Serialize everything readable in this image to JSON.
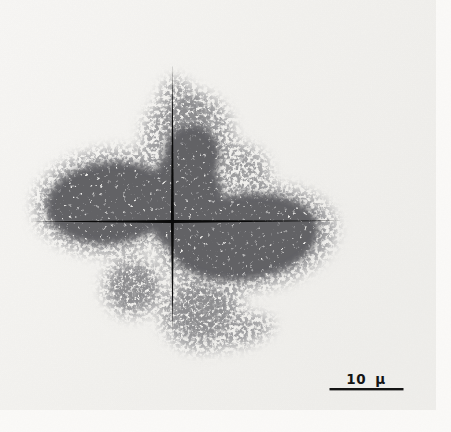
{
  "figure": {
    "kind": "micrograph-photograph",
    "scale_bar": {
      "label": "10 μ"
    },
    "colors": {
      "page": "#fbfaf8",
      "photo_background": "#f2f1ee",
      "grain_core": "#1f1f1f",
      "grain_mid": "#454545",
      "grain_halo": "#575757",
      "reticle": "#0a0a0a",
      "scale_bar": "#141414"
    }
  }
}
